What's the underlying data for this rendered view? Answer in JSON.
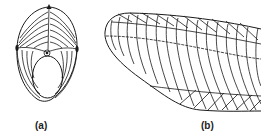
{
  "figure": {
    "panels": [
      {
        "id": "a",
        "label": "(a)",
        "description": "Front view: egg-shaped outline with radiating curved lines, top and side markers, central loop and inner elliptical opening"
      },
      {
        "id": "b",
        "label": "(b)",
        "description": "Side view: elongated tapered form with longitudinal centre line and chevron-shaped transverse curves"
      }
    ],
    "colors": {
      "line": "#1a1a1a",
      "background": "#ffffff"
    }
  }
}
